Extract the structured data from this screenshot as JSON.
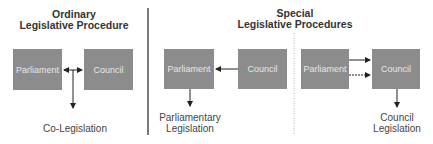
{
  "ordinary": {
    "title_line1": "Ordinary",
    "title_line2": "Legislative Procedure",
    "parliament": "Parliament",
    "council": "Council",
    "result": "Co-Legislation"
  },
  "special": {
    "title_line1": "Special",
    "title_line2": "Legislative Procedures",
    "parliamentary": {
      "parliament": "Parliament",
      "council": "Council",
      "result_line1": "Parliamentary",
      "result_line2": "Legislation"
    },
    "council": {
      "parliament": "Parliament",
      "council": "Council",
      "result_line1": "Council",
      "result_line2": "Legislation"
    }
  },
  "colors": {
    "box": "#8c8c8c",
    "box_text": "#e8e8e8",
    "line": "#333333"
  }
}
